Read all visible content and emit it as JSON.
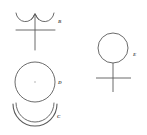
{
  "page": {
    "background_color": "#ffffff",
    "stroke_color": "#4a4a4a",
    "width": 147,
    "height": 135
  },
  "figures": [
    {
      "id": "figure-b",
      "label": "B",
      "description": "double-cup arcs with vertical stem and horizontal crossbar",
      "label_position": {
        "x": 58,
        "y": 19
      }
    },
    {
      "id": "figure-d",
      "label": "D",
      "description": "circle with center dot",
      "label_position": {
        "x": 58,
        "y": 80
      }
    },
    {
      "id": "figure-c",
      "label": "C",
      "description": "doubled downward bowl arc",
      "label_position": {
        "x": 57,
        "y": 114
      }
    },
    {
      "id": "figure-e",
      "label": "E",
      "description": "circle above vertical stem with horizontal crossbar",
      "label_position": {
        "x": 133,
        "y": 52
      }
    }
  ]
}
